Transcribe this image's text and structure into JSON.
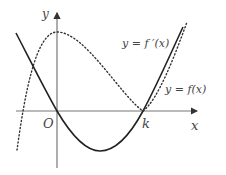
{
  "diagram": {
    "type": "function-graph",
    "axes": {
      "x_label": "x",
      "y_label": "y",
      "origin_label": "O",
      "x_marker_label": "k"
    },
    "curves": [
      {
        "id": "derivative",
        "label": "y = f ′(x)",
        "style": "solid",
        "color": "#222222",
        "description": "parabola with roots at 0 and k, opening upward"
      },
      {
        "id": "function",
        "label": "y = f(x)",
        "style": "dotted",
        "color": "#333333",
        "description": "cubic with local max at x=0 and local min (tangent to x-axis) at x=k"
      }
    ],
    "colors": {
      "axis": "#777777",
      "text": "#444444"
    }
  }
}
